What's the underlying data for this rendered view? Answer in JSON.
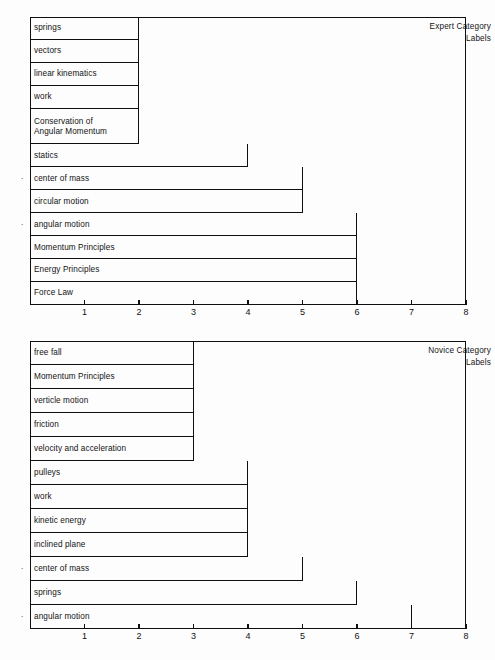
{
  "figure": {
    "background_color": "#fdfdfd",
    "line_color": "#0f0f0f",
    "marker_symbol": "·",
    "marker_note": "asterisk marker shown beside shared category labels"
  },
  "chart_data": [
    {
      "type": "bar",
      "orientation": "horizontal",
      "title": "Expert Category\nLabels",
      "title_position": "top-right-inside",
      "xlabel": "",
      "ylabel": "",
      "xlim": [
        0,
        8
      ],
      "xticks": [
        1,
        2,
        3,
        4,
        5,
        6,
        7,
        8
      ],
      "xticklabels": [
        "1",
        "2",
        "3",
        "4",
        "5",
        "6",
        "7",
        "8"
      ],
      "grid": false,
      "legend": false,
      "categories": [
        "springs",
        "vectors",
        "linear kinematics",
        "work",
        "Conservation of\nAngular Momentum",
        "statics",
        "center of mass",
        "circular motion",
        "angular motion",
        "Momentum Principles",
        "Energy Principles",
        "Force Law"
      ],
      "values": [
        2,
        2,
        2,
        2,
        2,
        4,
        5,
        5,
        6,
        6,
        6,
        6
      ],
      "starred": [
        false,
        false,
        false,
        false,
        false,
        false,
        true,
        false,
        true,
        false,
        false,
        false
      ],
      "row_weights": [
        1,
        1,
        1,
        1,
        1.55,
        1,
        1,
        1,
        1,
        1,
        1,
        1
      ]
    },
    {
      "type": "bar",
      "orientation": "horizontal",
      "title": "Novice Category\nLabels",
      "title_position": "top-right-inside",
      "xlabel": "",
      "ylabel": "",
      "xlim": [
        0,
        8
      ],
      "xticks": [
        1,
        2,
        3,
        4,
        5,
        6,
        7,
        8
      ],
      "xticklabels": [
        "1",
        "2",
        "3",
        "4",
        "5",
        "6",
        "7",
        "8"
      ],
      "grid": false,
      "legend": false,
      "categories": [
        "free fall",
        "Momentum Principles",
        "verticle motion",
        "friction",
        "velocity and acceleration",
        "pulleys",
        "work",
        "kinetic energy",
        "inclined plane",
        "center of mass",
        "springs",
        "angular motion"
      ],
      "values": [
        3,
        3,
        3,
        3,
        3,
        4,
        4,
        4,
        4,
        5,
        6,
        7
      ],
      "starred": [
        false,
        false,
        false,
        false,
        false,
        false,
        false,
        false,
        false,
        true,
        false,
        true
      ],
      "row_weights": [
        1,
        1,
        1,
        1,
        1,
        1,
        1,
        1,
        1,
        1,
        1,
        1
      ]
    }
  ]
}
